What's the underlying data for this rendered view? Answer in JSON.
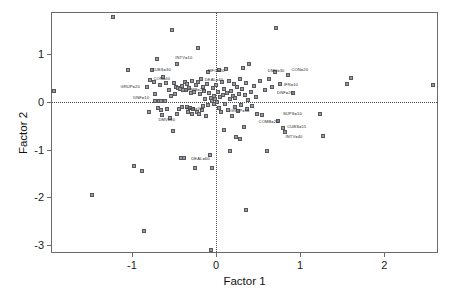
{
  "chart_data": {
    "type": "scatter",
    "title": "",
    "xlabel": "Factor 1",
    "ylabel": "Factor 2",
    "xlim": [
      -1.95,
      2.65
    ],
    "ylim": [
      -3.18,
      1.85
    ],
    "xticks": [
      -1,
      0,
      1,
      2
    ],
    "xticklabels": [
      "-1",
      "0",
      "1",
      "2"
    ],
    "yticks": [
      1,
      0,
      -1,
      -2,
      -3
    ],
    "yticklabels": [
      "1",
      "0",
      "-1",
      "-2",
      "-3"
    ],
    "grid": false,
    "legend": "none",
    "reference_lines": [
      {
        "axis": "x",
        "value": 0,
        "style": "dotted"
      },
      {
        "axis": "y",
        "value": 0,
        "style": "dotted"
      }
    ],
    "marker": {
      "shape": "square",
      "size": 4,
      "edge_color": "#57575c",
      "face_color": "#9a9aa0"
    },
    "points": [
      {
        "x": -1.93,
        "y": 0.22
      },
      {
        "x": -1.47,
        "y": -1.95
      },
      {
        "x": -1.23,
        "y": 1.77
      },
      {
        "x": -1.05,
        "y": 0.65
      },
      {
        "x": -0.98,
        "y": -1.34
      },
      {
        "x": -0.88,
        "y": -1.45
      },
      {
        "x": -0.86,
        "y": -2.7
      },
      {
        "x": -0.82,
        "y": 0.3
      },
      {
        "x": -0.8,
        "y": -0.22
      },
      {
        "x": -0.78,
        "y": 0.46
      },
      {
        "x": -0.76,
        "y": 0.67
      },
      {
        "x": -0.74,
        "y": 0.41
      },
      {
        "x": -0.73,
        "y": 0.16
      },
      {
        "x": -0.72,
        "y": 0.01
      },
      {
        "x": -0.7,
        "y": 0.89
      },
      {
        "x": -0.69,
        "y": -0.13
      },
      {
        "x": -0.68,
        "y": 0.02
      },
      {
        "x": -0.67,
        "y": 0.34
      },
      {
        "x": -0.66,
        "y": -0.17
      },
      {
        "x": -0.65,
        "y": 0.01
      },
      {
        "x": -0.64,
        "y": -0.28
      },
      {
        "x": -0.63,
        "y": 0.52
      },
      {
        "x": -0.61,
        "y": 0.02
      },
      {
        "x": -0.6,
        "y": 0.38
      },
      {
        "x": -0.58,
        "y": -0.16
      },
      {
        "x": -0.56,
        "y": 0.25
      },
      {
        "x": -0.55,
        "y": -0.34
      },
      {
        "x": -0.53,
        "y": 0.11
      },
      {
        "x": -0.52,
        "y": 1.49
      },
      {
        "x": -0.51,
        "y": -0.62
      },
      {
        "x": -0.5,
        "y": 0.39
      },
      {
        "x": -0.49,
        "y": 0.16
      },
      {
        "x": -0.48,
        "y": 0.3
      },
      {
        "x": -0.47,
        "y": -0.25
      },
      {
        "x": -0.46,
        "y": 0.78
      },
      {
        "x": -0.45,
        "y": 0.28
      },
      {
        "x": -0.44,
        "y": -0.15
      },
      {
        "x": -0.43,
        "y": 0.26
      },
      {
        "x": -0.42,
        "y": -1.17
      },
      {
        "x": -0.41,
        "y": 0.33
      },
      {
        "x": -0.4,
        "y": -0.12
      },
      {
        "x": -0.39,
        "y": 0.25
      },
      {
        "x": -0.38,
        "y": -1.18
      },
      {
        "x": -0.37,
        "y": 0.42
      },
      {
        "x": -0.36,
        "y": 0.24
      },
      {
        "x": -0.35,
        "y": -0.11
      },
      {
        "x": -0.34,
        "y": 0.37
      },
      {
        "x": -0.33,
        "y": -0.21
      },
      {
        "x": -0.32,
        "y": 0.29
      },
      {
        "x": -0.31,
        "y": -0.13
      },
      {
        "x": -0.3,
        "y": 0.17
      },
      {
        "x": -0.29,
        "y": -0.25
      },
      {
        "x": -0.28,
        "y": 0.44
      },
      {
        "x": -0.27,
        "y": -0.16
      },
      {
        "x": -0.26,
        "y": 0.21
      },
      {
        "x": -0.25,
        "y": -1.38
      },
      {
        "x": -0.24,
        "y": 0.34
      },
      {
        "x": -0.23,
        "y": -0.22
      },
      {
        "x": -0.22,
        "y": 1.12
      },
      {
        "x": -0.21,
        "y": 0.4
      },
      {
        "x": -0.2,
        "y": -0.26
      },
      {
        "x": -0.19,
        "y": 0.16
      },
      {
        "x": -0.18,
        "y": 0.47
      },
      {
        "x": -0.17,
        "y": -0.18
      },
      {
        "x": -0.16,
        "y": 0.31
      },
      {
        "x": -0.15,
        "y": -0.09
      },
      {
        "x": -0.14,
        "y": 0.23
      },
      {
        "x": -0.13,
        "y": 0.05
      },
      {
        "x": -0.12,
        "y": -0.29
      },
      {
        "x": -0.11,
        "y": 0.36
      },
      {
        "x": -0.1,
        "y": 0.62
      },
      {
        "x": -0.09,
        "y": -0.06
      },
      {
        "x": -0.08,
        "y": 0.18
      },
      {
        "x": -0.07,
        "y": -1.12
      },
      {
        "x": -0.06,
        "y": 0.08
      },
      {
        "x": -0.06,
        "y": -3.09
      },
      {
        "x": -0.05,
        "y": 0.02
      },
      {
        "x": -0.05,
        "y": -1.38
      },
      {
        "x": -0.04,
        "y": 0.29
      },
      {
        "x": -0.03,
        "y": 0.12
      },
      {
        "x": -0.02,
        "y": -0.04
      },
      {
        "x": -0.01,
        "y": 0.06
      },
      {
        "x": 0.0,
        "y": 0.34
      },
      {
        "x": 0.01,
        "y": 0.0
      },
      {
        "x": 0.02,
        "y": 0.2
      },
      {
        "x": 0.03,
        "y": -0.14
      },
      {
        "x": 0.04,
        "y": 0.66
      },
      {
        "x": 0.05,
        "y": 0.1
      },
      {
        "x": 0.06,
        "y": -0.22
      },
      {
        "x": 0.07,
        "y": 0.4
      },
      {
        "x": 0.08,
        "y": 0.14
      },
      {
        "x": 0.09,
        "y": -0.6
      },
      {
        "x": 0.1,
        "y": 0.27
      },
      {
        "x": 0.11,
        "y": -0.05
      },
      {
        "x": 0.12,
        "y": 0.68
      },
      {
        "x": 0.13,
        "y": 0.18
      },
      {
        "x": 0.14,
        "y": -0.18
      },
      {
        "x": 0.15,
        "y": 0.43
      },
      {
        "x": 0.16,
        "y": 0.05
      },
      {
        "x": 0.17,
        "y": -1.04
      },
      {
        "x": 0.18,
        "y": 0.22
      },
      {
        "x": 0.19,
        "y": -0.3
      },
      {
        "x": 0.2,
        "y": 0.12
      },
      {
        "x": 0.21,
        "y": 0.36
      },
      {
        "x": 0.22,
        "y": -0.12
      },
      {
        "x": 0.23,
        "y": 0.08
      },
      {
        "x": 0.24,
        "y": -0.74
      },
      {
        "x": 0.25,
        "y": 0.3
      },
      {
        "x": 0.26,
        "y": -0.2
      },
      {
        "x": 0.27,
        "y": 0.16
      },
      {
        "x": 0.28,
        "y": -0.78
      },
      {
        "x": 0.29,
        "y": 0.47
      },
      {
        "x": 0.3,
        "y": -0.08
      },
      {
        "x": 0.31,
        "y": 0.26
      },
      {
        "x": 0.32,
        "y": 0.7
      },
      {
        "x": 0.33,
        "y": -0.52
      },
      {
        "x": 0.34,
        "y": 0.14
      },
      {
        "x": 0.35,
        "y": -2.26
      },
      {
        "x": 0.36,
        "y": 0.38
      },
      {
        "x": 0.37,
        "y": -0.16
      },
      {
        "x": 0.38,
        "y": 0.04
      },
      {
        "x": 0.39,
        "y": 0.78
      },
      {
        "x": 0.41,
        "y": 0.2
      },
      {
        "x": 0.43,
        "y": -0.1
      },
      {
        "x": 0.45,
        "y": 0.33
      },
      {
        "x": 0.47,
        "y": 0.1
      },
      {
        "x": 0.49,
        "y": -0.26
      },
      {
        "x": 0.52,
        "y": 0.44
      },
      {
        "x": 0.55,
        "y": -0.28
      },
      {
        "x": 0.58,
        "y": 0.24
      },
      {
        "x": 0.6,
        "y": -1.02
      },
      {
        "x": 0.63,
        "y": 0.48
      },
      {
        "x": 0.66,
        "y": 0.3
      },
      {
        "x": 0.7,
        "y": 0.62
      },
      {
        "x": 0.71,
        "y": 1.53
      },
      {
        "x": 0.74,
        "y": -0.4
      },
      {
        "x": 0.76,
        "y": 0.36
      },
      {
        "x": 0.79,
        "y": -0.55
      },
      {
        "x": 0.82,
        "y": -0.63
      },
      {
        "x": 0.86,
        "y": 0.56
      },
      {
        "x": 0.92,
        "y": 0.18
      },
      {
        "x": 1.24,
        "y": -0.26
      },
      {
        "x": 1.27,
        "y": -0.72
      },
      {
        "x": 1.56,
        "y": 0.36
      },
      {
        "x": 1.6,
        "y": 0.5
      },
      {
        "x": 2.58,
        "y": 0.34
      }
    ],
    "annotations": [
      {
        "text": "INTV=10",
        "x": -0.52,
        "y": 0.905,
        "align": "left"
      },
      {
        "text": "CUBS=30",
        "x": -0.8,
        "y": 0.655,
        "align": "left"
      },
      {
        "text": "CON=40",
        "x": -0.78,
        "y": 0.475,
        "align": "left"
      },
      {
        "text": "GRUP=20",
        "x": -0.87,
        "y": 0.3,
        "align": "right"
      },
      {
        "text": "DNF=10",
        "x": -0.76,
        "y": 0.075,
        "align": "right"
      },
      {
        "text": "COMB=20",
        "x": -0.41,
        "y": 0.245,
        "align": "left"
      },
      {
        "text": "MFG=20",
        "x": -0.13,
        "y": 0.63,
        "align": "left"
      },
      {
        "text": "DEAL=40",
        "x": -0.17,
        "y": 0.45,
        "align": "left"
      },
      {
        "text": "WEB=30",
        "x": -0.4,
        "y": -0.145,
        "align": "left"
      },
      {
        "text": "DMV=60",
        "x": -0.72,
        "y": -0.38,
        "align": "left"
      },
      {
        "text": "GRUP=10",
        "x": 0.13,
        "y": -0.19,
        "align": "left"
      },
      {
        "text": "DEAL=60",
        "x": -0.33,
        "y": -1.19,
        "align": "left"
      },
      {
        "text": "DMV=30",
        "x": 0.58,
        "y": 0.64,
        "align": "left"
      },
      {
        "text": "CON=20",
        "x": 0.86,
        "y": 0.655,
        "align": "left"
      },
      {
        "text": "IFR=10",
        "x": 0.77,
        "y": 0.355,
        "align": "left"
      },
      {
        "text": "DNF=20",
        "x": 0.69,
        "y": 0.175,
        "align": "left"
      },
      {
        "text": "SUPS=10",
        "x": 0.76,
        "y": -0.255,
        "align": "left"
      },
      {
        "text": "COMB=20",
        "x": 0.47,
        "y": -0.425,
        "align": "left"
      },
      {
        "text": "CUBS=15",
        "x": 0.81,
        "y": -0.53,
        "align": "left"
      },
      {
        "text": "INTV=40",
        "x": 0.79,
        "y": -0.73,
        "align": "left"
      }
    ]
  }
}
